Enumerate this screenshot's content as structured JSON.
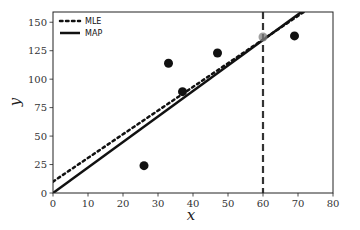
{
  "chart_data": {
    "type": "scatter",
    "title": "",
    "xlabel": "x",
    "ylabel": "y",
    "xlim": [
      0,
      80
    ],
    "ylim": [
      0,
      159
    ],
    "xticks": [
      0,
      10,
      20,
      30,
      40,
      50,
      60,
      70,
      80
    ],
    "yticks": [
      0,
      25,
      50,
      75,
      100,
      125,
      150
    ],
    "grid": false,
    "legend_position": "upper left",
    "points": [
      {
        "x": 26,
        "y": 24
      },
      {
        "x": 33,
        "y": 114
      },
      {
        "x": 37,
        "y": 89
      },
      {
        "x": 47,
        "y": 123
      },
      {
        "x": 69,
        "y": 138
      }
    ],
    "highlight_point": {
      "x": 60,
      "y": 137,
      "color": "#808080",
      "note": "gray prediction point on dashed line"
    },
    "vertical_line": {
      "x": 60,
      "style": "dashed",
      "color": "#333333"
    },
    "series": [
      {
        "name": "MLE",
        "type": "line",
        "style": "dotted",
        "intercept": 10,
        "slope": 2.08
      },
      {
        "name": "MAP",
        "type": "line",
        "style": "solid",
        "intercept": 0,
        "slope": 2.24
      }
    ]
  },
  "legend": {
    "items": [
      {
        "label": "MLE",
        "style": "dotted"
      },
      {
        "label": "MAP",
        "style": "solid"
      }
    ]
  },
  "axes": {
    "x_label": "x",
    "y_label": "y"
  }
}
